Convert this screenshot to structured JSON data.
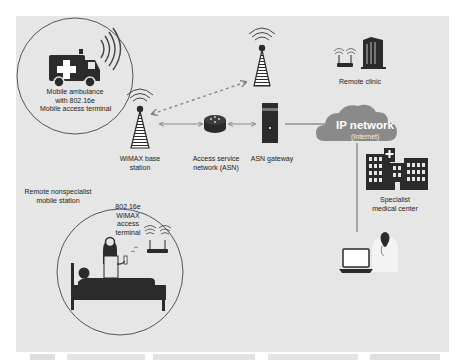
{
  "diagram": {
    "colors": {
      "panel": "#e6e6e6",
      "icon": "#2b2b2b",
      "cloud": "#8a8a8a",
      "line": "#555555",
      "dashed_link": "#8a8a8a"
    },
    "nodes": {
      "ambulance": {
        "icon": "ambulance-icon",
        "label_lines": [
          "Mobile ambulance",
          "with 802.16e",
          "Mobile access terminal"
        ]
      },
      "relay_tower": {
        "icon": "cell-tower-icon"
      },
      "base_station": {
        "icon": "cell-tower-icon",
        "label_lines": [
          "WiMAX base",
          "station"
        ]
      },
      "asn": {
        "icon": "router-icon",
        "label_lines": [
          "Access service",
          "network (ASN)"
        ]
      },
      "asn_gateway": {
        "icon": "server-icon",
        "label_lines": [
          "ASN gateway"
        ]
      },
      "remote_clinic": {
        "icon": "clinic-building-icon",
        "label_lines": [
          "Remote clinic"
        ]
      },
      "ip_network": {
        "icon": "cloud-icon",
        "title": "IP network",
        "subtitle": "(Internet)"
      },
      "specialist_center": {
        "icon": "hospital-icon",
        "label_lines": [
          "Specialist",
          "medical center"
        ]
      },
      "specialist_doctor": {
        "icon": "doctor-laptop-icon"
      },
      "remote_station": {
        "icon": "patient-bed-icon",
        "outer_label_lines": [
          "Remote nonspecialist",
          "mobile station"
        ],
        "inner_label_lines": [
          "802.16e",
          "WiMAX",
          "access",
          "terminal"
        ]
      }
    },
    "links": [
      {
        "from": "base_station",
        "to": "relay_tower",
        "style": "dashed",
        "arrows": "both"
      },
      {
        "from": "base_station",
        "to": "asn",
        "style": "solid",
        "arrows": "both"
      },
      {
        "from": "asn",
        "to": "asn_gateway",
        "style": "solid",
        "arrows": "both"
      },
      {
        "from": "asn_gateway",
        "to": "ip_network",
        "style": "solid",
        "arrows": "none"
      },
      {
        "from": "ip_network",
        "to": "specialist_doctor",
        "style": "solid",
        "arrows": "none"
      }
    ]
  }
}
